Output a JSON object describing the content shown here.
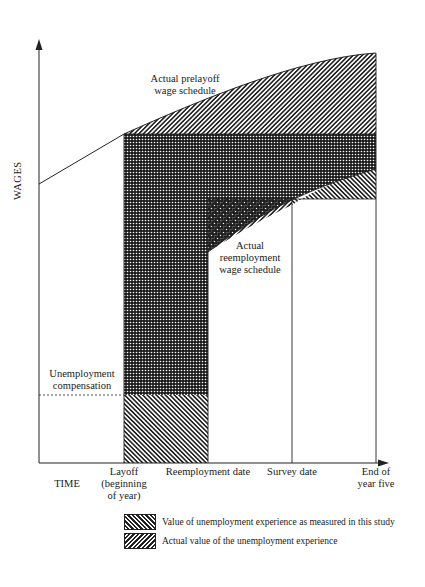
{
  "figure": {
    "y_axis_label": "WAGES",
    "x_axis_label": "TIME",
    "annotations": {
      "prelayoff": [
        "Actual prelayoff",
        "wage schedule"
      ],
      "reemployment": [
        "Actual",
        "reemployment",
        "wage schedule"
      ],
      "unemployment_comp": [
        "Unemployment",
        "compensation"
      ]
    },
    "x_ticks": [
      {
        "label_lines": [
          "Layoff",
          "(beginning",
          "of year)"
        ]
      },
      {
        "label_lines": [
          "Reemployment date"
        ]
      },
      {
        "label_lines": [
          "Survey date"
        ]
      },
      {
        "label_lines": [
          "End of",
          "year five"
        ]
      }
    ],
    "legend": [
      {
        "pattern": "hatch-backslash",
        "label": "Value of unemployment experience as measured in this study"
      },
      {
        "pattern": "hatch-slash",
        "label": "Actual value of the unemployment experience"
      }
    ]
  }
}
